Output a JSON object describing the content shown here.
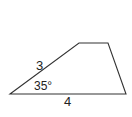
{
  "figure": {
    "type": "trapezoid",
    "stroke_color": "#333333",
    "vertices": {
      "bottom_left": [
        10,
        94
      ],
      "top_left": [
        79,
        43
      ],
      "top_right": [
        108,
        43
      ],
      "bottom_right": [
        126,
        94
      ]
    },
    "labels": {
      "slanted_side": "3",
      "angle": "35°",
      "base": "4"
    }
  }
}
